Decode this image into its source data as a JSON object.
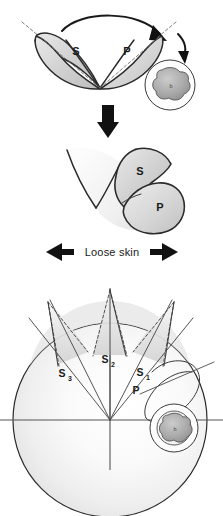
{
  "figure": {
    "background_color": "#ffffff",
    "ink_color": "#2b2b2b",
    "panels": [
      {
        "id": "panel-top",
        "name": "pre-rotation-flaps",
        "description": "V-shaped double flap with secondary and primary limbs before transposition",
        "labels": [
          "S",
          "P"
        ],
        "arrows": [
          "rotation-arc-arrow",
          "small-curved-arrow"
        ]
      },
      {
        "id": "panel-middle",
        "name": "post-rotation-flaps",
        "description": "Flaps after rotation, S folded over P",
        "labels": [
          "S",
          "P"
        ]
      },
      {
        "id": "panel-bottom",
        "name": "radial-segment-diagram",
        "description": "Circle with three dashed triangular flaps at the superior pole and radial segment rays",
        "labels": [
          "S3",
          "S2",
          "S1",
          "P"
        ]
      }
    ],
    "top_panel": {
      "flap_s_label": "S",
      "flap_p_label": "P",
      "nipple_inset_mark": "b"
    },
    "middle_panel": {
      "flap_s_label": "S",
      "flap_p_label": "P"
    },
    "caption_bar": {
      "text": "Loose skin",
      "left_arrow": "left-block-arrow",
      "right_arrow": "right-block-arrow"
    },
    "bottom_panel": {
      "segment_labels": [
        {
          "base": "S",
          "sub": "3",
          "x": 62,
          "y": 375
        },
        {
          "base": "S",
          "sub": "2",
          "x": 105,
          "y": 361
        },
        {
          "base": "S",
          "sub": "1",
          "x": 139,
          "y": 374
        }
      ],
      "pedicle_label": "P",
      "nipple_inset_mark": "b",
      "flap_count": 3,
      "axes": [
        "horizontal-axis",
        "vertical-axis"
      ]
    },
    "colors": {
      "ink": "#2b2b2b",
      "dash": "#6f6f6f",
      "fill_light": "#f2f2f2",
      "fill_mid": "#d8d8d8",
      "fill_dark": "#b8b8b8",
      "arrow": "#111111",
      "text": "#1a1a1a"
    }
  }
}
